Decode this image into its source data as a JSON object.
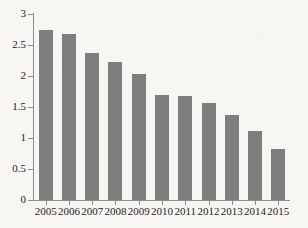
{
  "chart_data": {
    "type": "bar",
    "title": "",
    "subtitle": "",
    "xlabel": "",
    "ylabel": "",
    "categories": [
      "2005",
      "2006",
      "2007",
      "2008",
      "2009",
      "2010",
      "2011",
      "2012",
      "2013",
      "2014",
      "2015"
    ],
    "values": [
      2.74,
      2.68,
      2.37,
      2.23,
      2.03,
      1.69,
      1.68,
      1.56,
      1.37,
      1.11,
      0.83
    ],
    "series": [
      {
        "name": "value",
        "values": [
          2.74,
          2.68,
          2.37,
          2.23,
          2.03,
          1.69,
          1.68,
          1.56,
          1.37,
          1.11,
          0.83
        ]
      }
    ],
    "ylim": [
      0,
      3
    ],
    "xlim_categories": 11,
    "ytick_labels": [
      "0",
      "0.5",
      "1",
      "1.5",
      "2",
      "2.5",
      "3"
    ],
    "ytick_values": [
      0,
      0.5,
      1,
      1.5,
      2,
      2.5,
      3
    ],
    "xtick_labels": [
      "2005",
      "2006",
      "2007",
      "2008",
      "2009",
      "2010",
      "2011",
      "2012",
      "2013",
      "2014",
      "2015"
    ],
    "grid": false,
    "legend": false,
    "legend_position": "none",
    "annotations": [],
    "bar_color": "#7e7e7e",
    "axis_color": "#8d8d8d",
    "background_color": "#f7f6f3",
    "text_color": "#1d1d1d"
  }
}
